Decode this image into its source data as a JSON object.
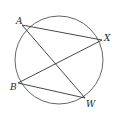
{
  "diagram": {
    "type": "circle-with-chords",
    "circle": {
      "cx": 59,
      "cy": 60,
      "r": 44,
      "stroke": "#555555"
    },
    "points": [
      {
        "name": "A",
        "label": "A",
        "x": 22,
        "y": 25,
        "lx": 16,
        "ly": 24
      },
      {
        "name": "X",
        "label": "X",
        "x": 102,
        "y": 40,
        "lx": 104,
        "ly": 41
      },
      {
        "name": "B",
        "label": "B",
        "x": 18,
        "y": 83,
        "lx": 10,
        "ly": 90
      },
      {
        "name": "W",
        "label": "W",
        "x": 85,
        "y": 98,
        "lx": 86,
        "ly": 107
      }
    ],
    "segments": [
      {
        "from": "A",
        "to": "X"
      },
      {
        "from": "A",
        "to": "W"
      },
      {
        "from": "B",
        "to": "X"
      },
      {
        "from": "B",
        "to": "W"
      }
    ],
    "line_color": "#333333"
  }
}
